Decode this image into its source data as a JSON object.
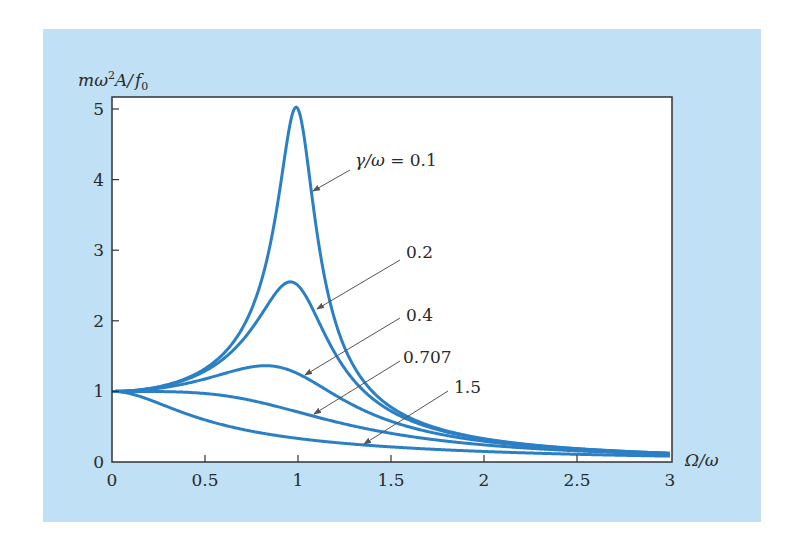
{
  "chart_data": {
    "type": "line",
    "title": "",
    "xlabel": "Ω/ω",
    "ylabel": "mω²A/f₀",
    "ylabel_parts": {
      "m": "m",
      "omega": "ω",
      "sup": "2",
      "A": "A/",
      "f": "f",
      "sub": "0"
    },
    "xlim": [
      0,
      3
    ],
    "ylim": [
      0,
      5
    ],
    "x_ticks": [
      0,
      0.5,
      1,
      1.5,
      2,
      2.5,
      3
    ],
    "x_tick_labels": [
      "0",
      "0.5",
      "1",
      "1.5",
      "2",
      "2.5",
      "3"
    ],
    "y_ticks": [
      0,
      1,
      2,
      3,
      4,
      5
    ],
    "y_tick_labels": [
      "0",
      "1",
      "2",
      "3",
      "4",
      "5"
    ],
    "grid": false,
    "legend": "inline annotations with arrows",
    "formula": "1/sqrt((1-r^2)^2 + 4 g^2 r^2), r=Ω/ω, g=γ/ω",
    "series": [
      {
        "name": "γ/ω = 0.1",
        "gamma": 0.1,
        "peak": {
          "x": 1.0,
          "y": 5.0
        },
        "label": "γ/ω = 0.1",
        "label_pos": [
          355,
          166
        ],
        "arrow_from": [
          350,
          170
        ],
        "arrow_to": [
          313,
          191
        ]
      },
      {
        "name": "0.2",
        "gamma": 0.2,
        "peak": {
          "x": 0.96,
          "y": 2.55
        },
        "label": "0.2",
        "label_pos": [
          406,
          258
        ],
        "arrow_from": [
          400,
          260
        ],
        "arrow_to": [
          317,
          309
        ]
      },
      {
        "name": "0.4",
        "gamma": 0.4,
        "peak": {
          "x": 0.82,
          "y": 1.36
        },
        "label": "0.4",
        "label_pos": [
          406,
          321
        ],
        "arrow_from": [
          400,
          318
        ],
        "arrow_to": [
          305,
          375
        ]
      },
      {
        "name": "0.707",
        "gamma": 0.707,
        "peak": {
          "x": 0,
          "y": 1.0
        },
        "label": "0.707",
        "label_pos": [
          403,
          363
        ],
        "arrow_from": [
          400,
          361
        ],
        "arrow_to": [
          314,
          414
        ]
      },
      {
        "name": "1.5",
        "gamma": 1.5,
        "peak": {
          "x": 0,
          "y": 1.0
        },
        "label": "1.5",
        "label_pos": [
          454,
          393
        ],
        "arrow_from": [
          448,
          391
        ],
        "arrow_to": [
          364,
          444
        ]
      }
    ],
    "colors": {
      "curve": "#2b7fc5",
      "axis": "#333333",
      "arrow": "#555555",
      "panel": "#bfe0f5",
      "plot_bg": "#ffffff"
    }
  }
}
